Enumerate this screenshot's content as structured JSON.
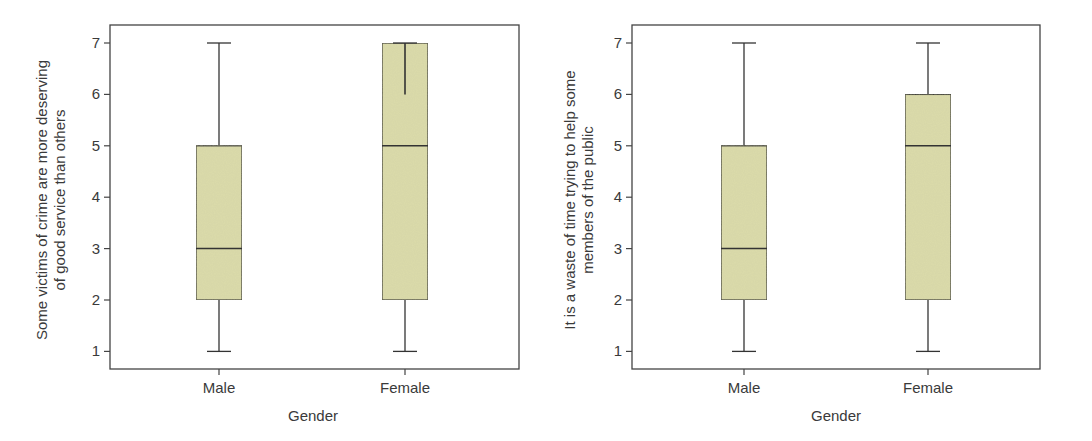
{
  "chart_data": [
    {
      "type": "box",
      "title": "",
      "xlabel": "Gender",
      "ylabel": "Some victims of crime are more deserving of good service than others",
      "ylabel_lines": [
        "Some victims of crime are more deserving",
        "of good service than others"
      ],
      "categories": [
        "Male",
        "Female"
      ],
      "yticks": [
        1,
        2,
        3,
        4,
        5,
        6,
        7
      ],
      "ylim": [
        0.65,
        7.35
      ],
      "grid": false,
      "legend": null,
      "box_color": "#dcdcaa",
      "series": [
        {
          "name": "Male",
          "min": 1,
          "q1": 2,
          "median": 3,
          "q3": 5,
          "max": 7
        },
        {
          "name": "Female",
          "min": 1,
          "q1": 2,
          "median": 5,
          "q3": 7,
          "max": 7,
          "note": "whisker line visible inside box from 6 to 7"
        }
      ]
    },
    {
      "type": "box",
      "title": "",
      "xlabel": "Gender",
      "ylabel": "It is a waste of time trying to help some members of the public",
      "ylabel_lines": [
        "It is a waste of time trying to help some",
        "members of the public"
      ],
      "categories": [
        "Male",
        "Female"
      ],
      "yticks": [
        1,
        2,
        3,
        4,
        5,
        6,
        7
      ],
      "ylim": [
        0.65,
        7.35
      ],
      "grid": false,
      "legend": null,
      "box_color": "#dcdcaa",
      "series": [
        {
          "name": "Male",
          "min": 1,
          "q1": 2,
          "median": 3,
          "q3": 5,
          "max": 7
        },
        {
          "name": "Female",
          "min": 1,
          "q1": 2,
          "median": 5,
          "q3": 6,
          "max": 7
        }
      ]
    }
  ]
}
